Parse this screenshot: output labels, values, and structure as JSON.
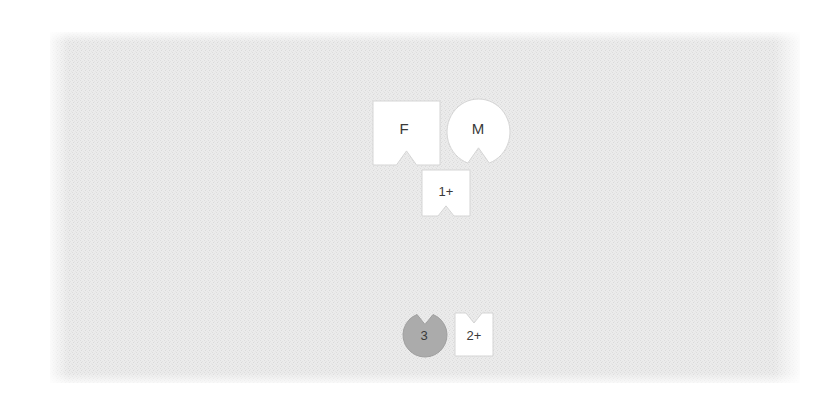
{
  "canvas": {
    "width": 838,
    "height": 401,
    "background_color": "#ffffff"
  },
  "panel": {
    "name": "diagram-canvas-panel",
    "x": 50,
    "y": 32,
    "width": 750,
    "height": 351,
    "fill_color": "#e9e9e9",
    "texture": "noise-dither",
    "texture_color": "#dcdcdc"
  },
  "diagram": {
    "type": "genogram",
    "default_fill": "#ffffff",
    "default_stroke": "#d0d0d0",
    "label_color": "#3a3a3a",
    "nodes": [
      {
        "id": "node-f",
        "name": "genogram-node-f",
        "label": "F",
        "shape": "square",
        "notch_side": "bottom",
        "x": 373,
        "y": 101,
        "width": 67,
        "height": 64,
        "fill_color": "#ffffff",
        "stroke_color": "#d5d5d5",
        "label_x": 404,
        "label_y": 129,
        "font_size": 15
      },
      {
        "id": "node-m",
        "name": "genogram-node-m",
        "label": "M",
        "shape": "circle",
        "notch_side": "bottom",
        "x": 447,
        "y": 99,
        "width": 63,
        "height": 66,
        "fill_color": "#ffffff",
        "stroke_color": "#d5d5d5",
        "label_x": 478,
        "label_y": 129,
        "font_size": 15
      },
      {
        "id": "node-1plus",
        "name": "genogram-node-1-plus",
        "label": "1+",
        "shape": "square",
        "notch_side": "bottom",
        "x": 422,
        "y": 170,
        "width": 48,
        "height": 46,
        "fill_color": "#ffffff",
        "stroke_color": "#d5d5d5",
        "label_x": 446,
        "label_y": 192,
        "font_size": 13
      },
      {
        "id": "node-3",
        "name": "genogram-node-3",
        "label": "3",
        "shape": "circle",
        "notch_side": "top",
        "x": 403,
        "y": 313,
        "width": 44,
        "height": 44,
        "fill_color": "#ababab",
        "stroke_color": "#a0a0a0",
        "label_x": 424,
        "label_y": 336,
        "font_size": 13
      },
      {
        "id": "node-2plus",
        "name": "genogram-node-2-plus",
        "label": "2+",
        "shape": "square",
        "notch_side": "top",
        "x": 455,
        "y": 313,
        "width": 38,
        "height": 43,
        "fill_color": "#ffffff",
        "stroke_color": "#d5d5d5",
        "label_x": 474,
        "label_y": 336,
        "font_size": 13
      }
    ]
  }
}
